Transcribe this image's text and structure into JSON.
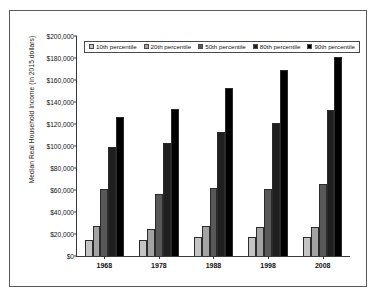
{
  "chart_data": {
    "type": "bar",
    "title": "",
    "xlabel": "",
    "ylabel": "Median Real Household Income (in 2015 dollars)",
    "categories": [
      "1968",
      "1978",
      "1988",
      "1998",
      "2008"
    ],
    "ylim": [
      0,
      200000
    ],
    "ytick_values": [
      0,
      20000,
      40000,
      60000,
      80000,
      100000,
      120000,
      140000,
      160000,
      180000,
      200000
    ],
    "ytick_labels": [
      "$0",
      "$20,000",
      "$40,000",
      "$60,000",
      "$80,000",
      "$100,000",
      "$120,000",
      "$140,000",
      "$160,000",
      "$180,000",
      "$200,000"
    ],
    "grid": false,
    "legend_position": "top-left-inside",
    "series": [
      {
        "name": "10th percentile",
        "color": "#c4c4c4",
        "values": [
          15000,
          15000,
          17000,
          17000,
          17000
        ]
      },
      {
        "name": "20th percentile",
        "color": "#a3a3a3",
        "values": [
          27000,
          25000,
          27000,
          26000,
          26500
        ]
      },
      {
        "name": "50th percentile",
        "color": "#585858",
        "values": [
          60500,
          56500,
          61500,
          61000,
          65500
        ]
      },
      {
        "name": "80th percentile",
        "color": "#1f1f1f",
        "values": [
          99500,
          103000,
          113000,
          121000,
          132500
        ]
      },
      {
        "name": "90th percentile",
        "color": "#000000",
        "values": [
          126500,
          134000,
          152500,
          169000,
          181000
        ]
      }
    ]
  }
}
